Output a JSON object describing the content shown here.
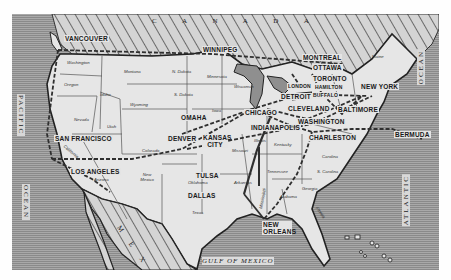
{
  "map": {
    "title": "North American routes map",
    "colors": {
      "land": "#e6e6e6",
      "ocean_dark": "#8a8a8a",
      "ocean_light": "#a9a9a9",
      "foreign": "#cfcfcf",
      "route": "#3a3a3a",
      "border": "#555555"
    },
    "regions": {
      "canada": "C A N A D A",
      "mexico": "M E X I C O",
      "pacific": "PACIFIC",
      "pacific_ocean": "OCEAN",
      "atlantic": "ATLANTIC",
      "atlantic_ocean": "OCEAN",
      "gulf": "GULF OF MEXICO"
    },
    "cities": {
      "vancouver": "VANCOUVER",
      "winnipeg": "WINNIPEG",
      "montreal": "MONTREAL",
      "ottawa": "OTTAWA",
      "toronto": "TORONTO",
      "buffalo": "BUFFALO",
      "hamilton": "HAMILTON",
      "london": "LONDON",
      "detroit": "DETROIT",
      "new_york": "NEW YORK",
      "chicago": "CHICAGO",
      "cleveland": "CLEVELAND",
      "baltimore": "BALTIMORE",
      "omaha": "OMAHA",
      "indianapolis": "INDIANAPOLIS",
      "washington": "WASHINGTON",
      "san_francisco": "SAN FRANCISCO",
      "denver": "DENVER",
      "kansas_city": "KANSAS CITY",
      "charleston": "CHARLESTON",
      "bermuda": "BERMUDA",
      "los_angeles": "LOS ANGELES",
      "tulsa": "TULSA",
      "dallas": "DALLAS",
      "new_orleans": "NEW ORLEANS"
    },
    "states": {
      "washington": "Washington",
      "oregon": "Oregon",
      "idaho": "Idaho",
      "montana": "Montana",
      "wyoming": "Wyoming",
      "n_dakota": "N. Dakota",
      "s_dakota": "S. Dakota",
      "minnesota": "Minnesota",
      "wisconsin": "Wisconsin",
      "iowa": "Iowa",
      "nevada": "Nevada",
      "utah": "Utah",
      "colorado": "Colorado",
      "california": "California",
      "arizona": "Arizona",
      "new_mexico": "New Mexico",
      "oklahoma": "Oklahoma",
      "texas": "Texas",
      "missouri": "Missouri",
      "arkansas": "Arkansas",
      "kentucky": "Kentucky",
      "tennessee": "Tennessee",
      "mississippi": "Mississippi",
      "alabama": "Alabama",
      "georgia": "Georgia",
      "florida": "Florida",
      "s_carolina": "S. Carolina",
      "carolina": "Carolina",
      "illinois": "Illinois",
      "ohio": "Ohio",
      "maine": "Maine"
    }
  }
}
